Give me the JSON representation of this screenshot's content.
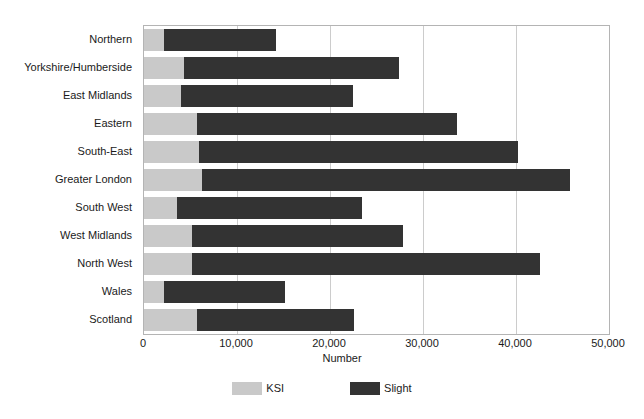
{
  "chart_data": {
    "type": "bar",
    "orientation": "horizontal",
    "stacked": true,
    "title": "",
    "xlabel": "Number",
    "ylabel": "",
    "xlim": [
      0,
      50000
    ],
    "xticks": [
      "0",
      "10,000",
      "20,000",
      "30,000",
      "40,000",
      "50,000"
    ],
    "xtick_values": [
      0,
      10000,
      20000,
      30000,
      40000,
      50000
    ],
    "grid": "vertical",
    "legend_position": "bottom-center",
    "categories": [
      "Northern",
      "Yorkshire/Humberside",
      "East Midlands",
      "Eastern",
      "South-East",
      "Greater London",
      "South West",
      "West Midlands",
      "North West",
      "Wales",
      "Scotland"
    ],
    "series": [
      {
        "name": "KSI",
        "color": "#c9c9c9",
        "values": [
          2100,
          4300,
          4000,
          5700,
          5950,
          6200,
          3500,
          5200,
          5200,
          2100,
          5700
        ]
      },
      {
        "name": "Slight",
        "color": "#333333",
        "values": [
          12100,
          23100,
          18500,
          28000,
          34250,
          39650,
          19900,
          22700,
          37400,
          13100,
          16900
        ]
      }
    ],
    "totals": [
      14200,
      27400,
      22500,
      33700,
      40200,
      45850,
      23400,
      27900,
      42600,
      15200,
      22600
    ]
  },
  "legend": {
    "items": [
      {
        "label": "KSI",
        "color": "#c9c9c9"
      },
      {
        "label": "Slight",
        "color": "#333333"
      }
    ]
  }
}
